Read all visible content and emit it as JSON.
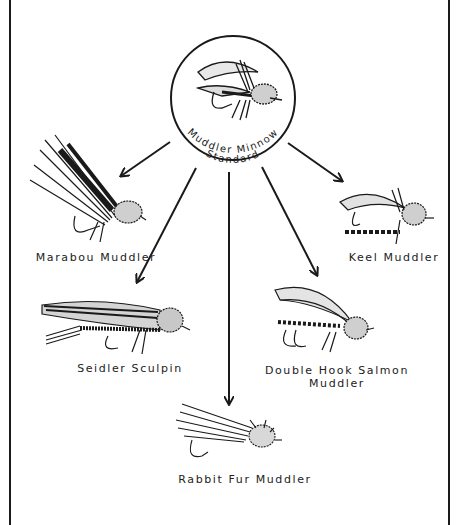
{
  "diagram": {
    "type": "hierarchy",
    "center": {
      "label_line1": "Standard",
      "label_line2": "Muddler Minnow",
      "icon": "fly-icon"
    },
    "variants": [
      {
        "label": "Marabou Muddler",
        "icon": "marabou-fly-icon"
      },
      {
        "label": "Keel Muddler",
        "icon": "keel-fly-icon"
      },
      {
        "label": "Seidler Sculpin",
        "icon": "sculpin-fly-icon"
      },
      {
        "label_line1": "Double Hook Salmon",
        "label_line2": "Muddler",
        "icon": "salmon-fly-icon"
      },
      {
        "label": "Rabbit Fur Muddler",
        "icon": "rabbit-fur-fly-icon"
      }
    ],
    "colors": {
      "ink": "#1a1a1a",
      "paper": "#ffffff"
    }
  }
}
